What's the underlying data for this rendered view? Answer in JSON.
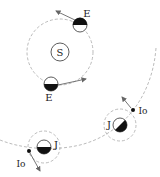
{
  "labels": {
    "sun": "S",
    "earth_top": "E",
    "earth_bottom": "E",
    "jupiter_right": "J",
    "jupiter_left": "J",
    "io_right": "Io",
    "io_left": "Io"
  },
  "colors": {
    "line": "#333333",
    "dashed": "#aaaaaa",
    "arrow": "#666666"
  }
}
